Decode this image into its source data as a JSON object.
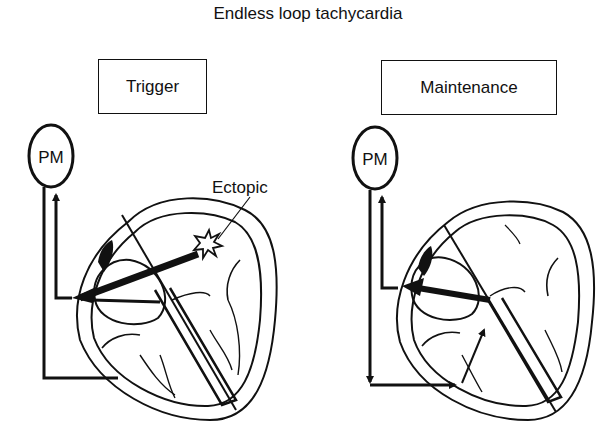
{
  "title": "Endless loop tachycardia",
  "panels": [
    {
      "label": "Trigger",
      "device_label": "PM",
      "annotation": "Ectopic"
    },
    {
      "label": "Maintenance",
      "device_label": "PM"
    }
  ]
}
